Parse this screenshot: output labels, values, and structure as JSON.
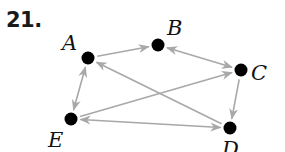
{
  "problem": {
    "number": "21."
  },
  "graph": {
    "type": "directed",
    "edge_color": "#a8a8a8",
    "node_color": "#000000",
    "nodes": [
      {
        "id": "A",
        "label": "A",
        "x": 88,
        "y": 58,
        "lx": 62,
        "ly": 50
      },
      {
        "id": "B",
        "label": "B",
        "x": 158,
        "y": 45,
        "lx": 167,
        "ly": 35
      },
      {
        "id": "C",
        "label": "C",
        "x": 241,
        "y": 70,
        "lx": 251,
        "ly": 80
      },
      {
        "id": "D",
        "label": "D",
        "x": 230,
        "y": 128,
        "lx": 222,
        "ly": 156
      },
      {
        "id": "E",
        "label": "E",
        "x": 71,
        "y": 119,
        "lx": 48,
        "ly": 147
      }
    ],
    "edges": [
      {
        "from": "A",
        "to": "B",
        "direction": "forward"
      },
      {
        "from": "B",
        "to": "C",
        "direction": "both"
      },
      {
        "from": "A",
        "to": "E",
        "direction": "both"
      },
      {
        "from": "D",
        "to": "A",
        "direction": "forward"
      },
      {
        "from": "E",
        "to": "C",
        "direction": "forward"
      },
      {
        "from": "C",
        "to": "D",
        "direction": "forward"
      },
      {
        "from": "E",
        "to": "D",
        "direction": "both"
      }
    ]
  }
}
